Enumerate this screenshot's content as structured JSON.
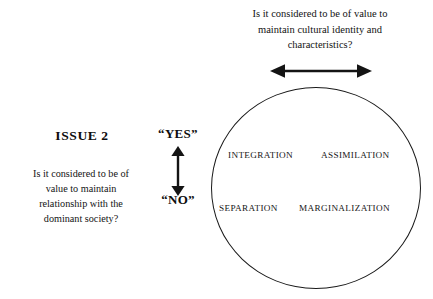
{
  "diagram": {
    "title_text": "ISSUE 2",
    "top_question": {
      "lines": [
        "Is it considered to be of value to",
        "maintain cultural identity and",
        "characteristics?"
      ],
      "full": "Is it considered to be of value to maintain cultural identity and characteristics?"
    },
    "left_question": {
      "lines": [
        "Is it considered to be of",
        "value to maintain",
        "relationship with the",
        "dominant society?"
      ],
      "full": "Is it considered to be of value to maintain relationship with the dominant society?"
    },
    "vertical_axis": {
      "top_label": "“YES”",
      "bottom_label": "“NO”",
      "arrow_name": "vertical-double-arrow"
    },
    "horizontal_axis": {
      "arrow_name": "horizontal-double-arrow"
    },
    "quadrants": [
      {
        "id": "integration",
        "label": "INTEGRATION",
        "position": "top-left"
      },
      {
        "id": "assimilation",
        "label": "ASSIMILATION",
        "position": "top-right"
      },
      {
        "id": "separation",
        "label": "SEPARATION",
        "position": "bottom-left"
      },
      {
        "id": "marginalization",
        "label": "MARGINALIZATION",
        "position": "bottom-right"
      }
    ],
    "colors": {
      "background": "#ffffff",
      "stroke": "#1a1a1a",
      "text": "#111111"
    }
  }
}
